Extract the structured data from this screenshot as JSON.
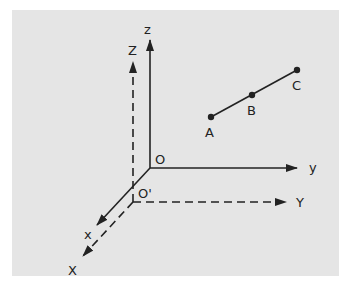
{
  "diagram": {
    "type": "coordinate-systems",
    "colors": {
      "background": "#e5e5e5",
      "ink": "#222222"
    },
    "system_xyz": {
      "origin_label": "O",
      "axes": [
        {
          "name": "x",
          "label": "x",
          "style": "solid"
        },
        {
          "name": "y",
          "label": "y",
          "style": "solid"
        },
        {
          "name": "z",
          "label": "z",
          "style": "solid"
        }
      ]
    },
    "system_XYZ": {
      "origin_label": "O'",
      "axes": [
        {
          "name": "X",
          "label": "X",
          "style": "dashed"
        },
        {
          "name": "Y",
          "label": "Y",
          "style": "dashed"
        },
        {
          "name": "Z",
          "label": "Z",
          "style": "dashed"
        }
      ]
    },
    "points": [
      {
        "label": "A"
      },
      {
        "label": "B"
      },
      {
        "label": "C"
      }
    ]
  }
}
